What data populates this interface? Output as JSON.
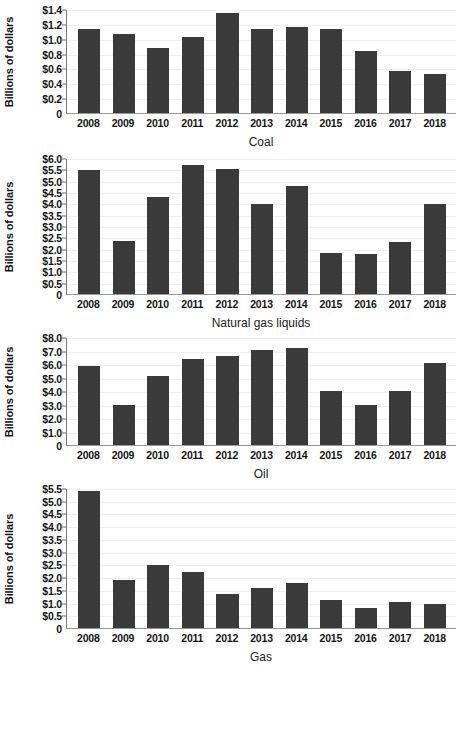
{
  "figure": {
    "ylabel": "Billions of dollars",
    "categories": [
      "2008",
      "2009",
      "2010",
      "2011",
      "2012",
      "2013",
      "2014",
      "2015",
      "2016",
      "2017",
      "2018"
    ],
    "bar_color": "#3a3a3a",
    "grid_color": "#f0f0f0",
    "axis_color": "#7a7a7a"
  },
  "panels": [
    {
      "title": "Coal",
      "ylabel": "Billions of dollars",
      "ylim": [
        0,
        1.4
      ],
      "ytick_values": [
        0,
        0.2,
        0.4,
        0.6,
        0.8,
        1.0,
        1.2,
        1.4
      ],
      "ytick_labels": [
        "0",
        "$0.2",
        "$0.4",
        "$0.6",
        "$0.8",
        "$1.0",
        "$1.2",
        "$1.4"
      ],
      "values": [
        1.13,
        1.07,
        0.87,
        1.03,
        1.35,
        1.13,
        1.16,
        1.13,
        0.83,
        0.56,
        0.52
      ]
    },
    {
      "title": "Natural gas liquids",
      "ylabel": "Billions of dollars",
      "ylim": [
        0,
        6.0
      ],
      "ytick_values": [
        0,
        0.5,
        1.0,
        1.5,
        2.0,
        2.5,
        3.0,
        3.5,
        4.0,
        4.5,
        5.0,
        5.5,
        6.0
      ],
      "ytick_labels": [
        "0",
        "$0.5",
        "$1.0",
        "$1.5",
        "$2.0",
        "$2.5",
        "$3.0",
        "$3.5",
        "$4.0",
        "$4.5",
        "$5.0",
        "$5.5",
        "$6.0"
      ],
      "values": [
        5.45,
        2.35,
        4.27,
        5.7,
        5.5,
        3.98,
        4.75,
        1.8,
        1.76,
        2.28,
        3.98
      ]
    },
    {
      "title": "Oil",
      "ylabel": "Billions of dollars",
      "ylim": [
        0,
        8.0
      ],
      "ytick_values": [
        0,
        1.0,
        2.0,
        3.0,
        4.0,
        5.0,
        6.0,
        7.0,
        8.0
      ],
      "ytick_labels": [
        "0",
        "$1.0",
        "$2.0",
        "$3.0",
        "$4.0",
        "$5.0",
        "$6.0",
        "$7.0",
        "$8.0"
      ],
      "values": [
        5.83,
        2.97,
        5.12,
        6.4,
        6.62,
        7.02,
        7.15,
        4.02,
        2.98,
        3.98,
        6.07
      ]
    },
    {
      "title": "Gas",
      "ylabel": "Billions of dollars",
      "ylim": [
        0,
        5.5
      ],
      "ytick_values": [
        0,
        0.5,
        1.0,
        1.5,
        2.0,
        2.5,
        3.0,
        3.5,
        4.0,
        4.5,
        5.0,
        5.5
      ],
      "ytick_labels": [
        "0",
        "$0.5",
        "$1.0",
        "$1.5",
        "$2.0",
        "$2.5",
        "$3.0",
        "$3.5",
        "$4.0",
        "$4.5",
        "$5.0",
        "$5.5"
      ],
      "values": [
        5.37,
        1.88,
        2.47,
        2.2,
        1.32,
        1.58,
        1.75,
        1.11,
        0.8,
        1.01,
        0.96
      ]
    }
  ],
  "chart_data": [
    {
      "type": "bar",
      "title": "Coal",
      "xlabel": "Coal",
      "ylabel": "Billions of dollars",
      "categories": [
        "2008",
        "2009",
        "2010",
        "2011",
        "2012",
        "2013",
        "2014",
        "2015",
        "2016",
        "2017",
        "2018"
      ],
      "values": [
        1.13,
        1.07,
        0.87,
        1.03,
        1.35,
        1.13,
        1.16,
        1.13,
        0.83,
        0.56,
        0.52
      ],
      "ylim": [
        0,
        1.4
      ],
      "yticks": [
        0,
        0.2,
        0.4,
        0.6,
        0.8,
        1.0,
        1.2,
        1.4
      ],
      "grid": true,
      "legend": "none",
      "units": "billions of dollars"
    },
    {
      "type": "bar",
      "title": "Natural gas liquids",
      "xlabel": "Natural gas liquids",
      "ylabel": "Billions of dollars",
      "categories": [
        "2008",
        "2009",
        "2010",
        "2011",
        "2012",
        "2013",
        "2014",
        "2015",
        "2016",
        "2017",
        "2018"
      ],
      "values": [
        5.45,
        2.35,
        4.27,
        5.7,
        5.5,
        3.98,
        4.75,
        1.8,
        1.76,
        2.28,
        3.98
      ],
      "ylim": [
        0,
        6.0
      ],
      "yticks": [
        0,
        0.5,
        1.0,
        1.5,
        2.0,
        2.5,
        3.0,
        3.5,
        4.0,
        4.5,
        5.0,
        5.5,
        6.0
      ],
      "grid": true,
      "legend": "none",
      "units": "billions of dollars"
    },
    {
      "type": "bar",
      "title": "Oil",
      "xlabel": "Oil",
      "ylabel": "Billions of dollars",
      "categories": [
        "2008",
        "2009",
        "2010",
        "2011",
        "2012",
        "2013",
        "2014",
        "2015",
        "2016",
        "2017",
        "2018"
      ],
      "values": [
        5.83,
        2.97,
        5.12,
        6.4,
        6.62,
        7.02,
        7.15,
        4.02,
        2.98,
        3.98,
        6.07
      ],
      "ylim": [
        0,
        8.0
      ],
      "yticks": [
        0,
        1.0,
        2.0,
        3.0,
        4.0,
        5.0,
        6.0,
        7.0,
        8.0
      ],
      "grid": true,
      "legend": "none",
      "units": "billions of dollars"
    },
    {
      "type": "bar",
      "title": "Gas",
      "xlabel": "Gas",
      "ylabel": "Billions of dollars",
      "categories": [
        "2008",
        "2009",
        "2010",
        "2011",
        "2012",
        "2013",
        "2014",
        "2015",
        "2016",
        "2017",
        "2018"
      ],
      "values": [
        5.37,
        1.88,
        2.47,
        2.2,
        1.32,
        1.58,
        1.75,
        1.11,
        0.8,
        1.01,
        0.96
      ],
      "ylim": [
        0,
        5.5
      ],
      "yticks": [
        0,
        0.5,
        1.0,
        1.5,
        2.0,
        2.5,
        3.0,
        3.5,
        4.0,
        4.5,
        5.0,
        5.5
      ],
      "grid": true,
      "legend": "none",
      "units": "billions of dollars"
    }
  ]
}
